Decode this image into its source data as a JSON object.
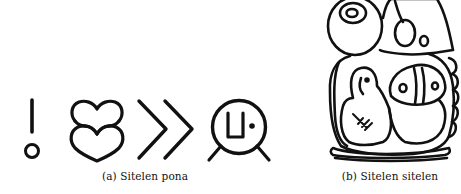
{
  "figure": {
    "subfigures": [
      {
        "id": "a",
        "caption": "(a) Sitelen pona",
        "glyphs": [
          {
            "name": "exclamation-glyph-icon"
          },
          {
            "name": "double-heart-glyph-icon"
          },
          {
            "name": "double-chevron-glyph-icon"
          },
          {
            "name": "circle-face-glyph-icon"
          }
        ]
      },
      {
        "id": "b",
        "caption": "(b) Sitelen sitelen",
        "glyphs": [
          {
            "name": "sitelen-sitelen-block-glyph-icon"
          }
        ]
      }
    ],
    "colors": {
      "ink": "#111111",
      "background": "#ffffff"
    }
  }
}
